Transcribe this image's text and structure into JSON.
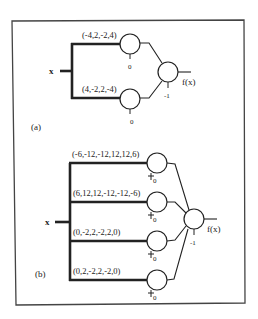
{
  "panel_a": {
    "label": "(a)",
    "input_label": "x",
    "output_label": "f(x)",
    "hidden": [
      {
        "weights": "(-4,2,-2,4)",
        "bias": "0"
      },
      {
        "weights": "(4,-2,2,-4)",
        "bias": "0"
      }
    ],
    "output_bias": "-1"
  },
  "panel_b": {
    "label": "(b)",
    "input_label": "x",
    "output_label": "f(x)",
    "hidden": [
      {
        "weights": "(-6,-12,-12,12,12,6)",
        "bias": "0"
      },
      {
        "weights": "(6,12,12,-12,-12,-6)",
        "bias": "0"
      },
      {
        "weights": "(0,-2,2,-2,2,0)",
        "bias": "0"
      },
      {
        "weights": "(0,2,-2,2,-2,0)",
        "bias": "0"
      }
    ],
    "output_bias": "-1"
  },
  "colors": {
    "ink": "#222222",
    "frame": "#444444",
    "background": "#ffffff"
  }
}
